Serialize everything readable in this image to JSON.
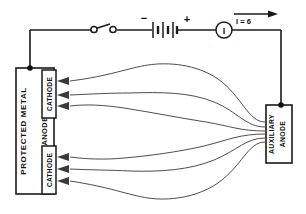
{
  "figure": {
    "background_color": "#ffffff",
    "line_color": "#1a1a1a"
  },
  "circuit": {
    "switch": {
      "name": "open-knife-switch",
      "state": "open"
    },
    "battery": {
      "negative_label": "−",
      "positive_label": "+",
      "cells": 3
    },
    "ammeter": {
      "symbol": "I"
    },
    "current": {
      "label": "I = 6",
      "direction": "right"
    }
  },
  "structures": {
    "protected_metal": {
      "label": "PROTECTED METAL",
      "anode_label": "ANODE",
      "cathodes": [
        {
          "label": "CATHODE",
          "position": "upper"
        },
        {
          "label": "CATHODE",
          "position": "lower"
        }
      ]
    },
    "auxiliary_anode": {
      "label_line1": "AUXILIARY",
      "label_line2": "ANODE"
    }
  },
  "current_paths": {
    "count": 6,
    "arrow_direction": "into-cathode",
    "upper_arrows": 3,
    "lower_arrows": 3
  }
}
